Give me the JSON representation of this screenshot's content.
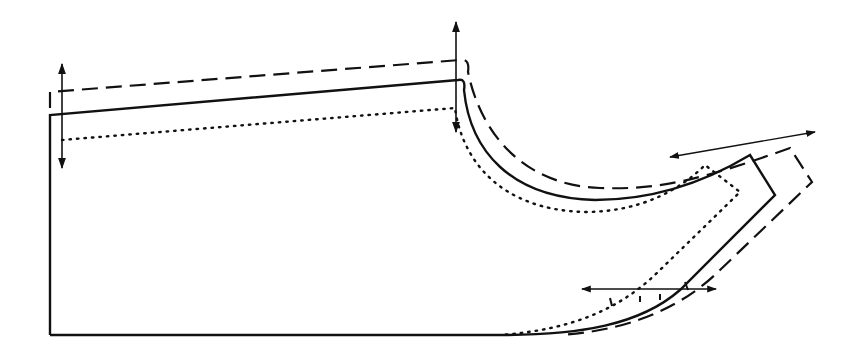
{
  "diagram": {
    "type": "pattern-grading-diagram",
    "colors": {
      "stroke": "#111111",
      "background": "#ffffff"
    },
    "outlines": [
      {
        "name": "base-size",
        "style": "solid"
      },
      {
        "name": "larger-size",
        "style": "dashed"
      },
      {
        "name": "smaller-size",
        "style": "dotted"
      }
    ],
    "arrows": [
      {
        "name": "left-vertical-arrow",
        "direction": "vertical",
        "x": 62,
        "y1": 62,
        "y2": 170
      },
      {
        "name": "center-vertical-arrow",
        "direction": "vertical",
        "x": 456,
        "y1": 20,
        "y2": 133
      },
      {
        "name": "upper-right-diagonal-arrow",
        "direction": "horizontal-diagonal",
        "x1": 668,
        "y1": 157,
        "x2": 816,
        "y2": 132
      },
      {
        "name": "lower-right-horizontal-arrow",
        "direction": "horizontal",
        "x1": 580,
        "y1": 289,
        "x2": 717,
        "y2": 289
      }
    ]
  }
}
